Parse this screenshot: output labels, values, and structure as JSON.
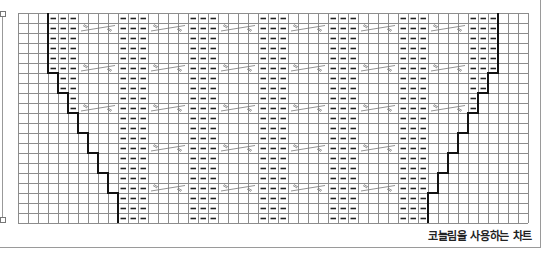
{
  "title": "코늘림을 사용하는 차트",
  "grid": {
    "cols": 51,
    "rows": 21,
    "cell_px": 10,
    "origin_x": 18,
    "origin_y": 13,
    "line_color": "#8c8c8c",
    "outline_color": "#111111"
  },
  "symbols": {
    "purl": "purl-dash",
    "cable": "cable-crossing-4-stitch"
  },
  "pattern": {
    "repeat": 7,
    "purl_block_starts": [
      3,
      10,
      17,
      24,
      31,
      38,
      45
    ],
    "purl_block_width": 3,
    "cable_block_starts": [
      6,
      13,
      20,
      27,
      34,
      41
    ],
    "cable_block_width": 4,
    "cable_rows": [
      1,
      5,
      9,
      13,
      17
    ],
    "edge_cable_rows": [
      1,
      5,
      9
    ]
  },
  "left_outline_steps": [
    {
      "rows": [
        0,
        5
      ],
      "boundary": 3
    },
    {
      "rows": [
        6,
        7
      ],
      "boundary": 4
    },
    {
      "rows": [
        8,
        9
      ],
      "boundary": 5
    },
    {
      "rows": [
        10,
        11
      ],
      "boundary": 6
    },
    {
      "rows": [
        12,
        13
      ],
      "boundary": 7
    },
    {
      "rows": [
        14,
        15
      ],
      "boundary": 8
    },
    {
      "rows": [
        16,
        17
      ],
      "boundary": 9
    },
    {
      "rows": [
        18,
        20
      ],
      "boundary": 10
    }
  ],
  "right_outline_steps": [
    {
      "rows": [
        0,
        5
      ],
      "boundary": 48
    },
    {
      "rows": [
        6,
        7
      ],
      "boundary": 47
    },
    {
      "rows": [
        8,
        9
      ],
      "boundary": 46
    },
    {
      "rows": [
        10,
        11
      ],
      "boundary": 45
    },
    {
      "rows": [
        12,
        13
      ],
      "boundary": 44
    },
    {
      "rows": [
        14,
        15
      ],
      "boundary": 43
    },
    {
      "rows": [
        16,
        17
      ],
      "boundary": 42
    },
    {
      "rows": [
        18,
        20
      ],
      "boundary": 41
    }
  ]
}
